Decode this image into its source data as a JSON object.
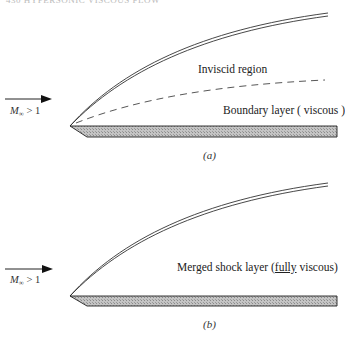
{
  "header": {
    "text": "430   HYPERSONIC VISCOUS FLOW"
  },
  "panel_a": {
    "caption": "(a)",
    "freestream": {
      "symbol": "M",
      "subscript": "∞",
      "relation": " > 1"
    },
    "labels": {
      "inviscid": "Inviscid region",
      "boundary_layer": "Boundary layer ( viscous )"
    },
    "elements": [
      "shock-wave",
      "boundary-layer-edge-dashed",
      "flat-plate",
      "freestream-arrow"
    ]
  },
  "panel_b": {
    "caption": "(b)",
    "freestream": {
      "symbol": "M",
      "subscript": "∞",
      "relation": " > 1"
    },
    "labels": {
      "merged_pre": "Merged shock layer (",
      "merged_underlined": "fully",
      "merged_post": " viscous)"
    },
    "elements": [
      "shock-wave",
      "flat-plate",
      "freestream-arrow"
    ]
  },
  "colors": {
    "line": "#2a2a2a",
    "plate_fill": "#b8b8b8",
    "dash": "#444444"
  }
}
